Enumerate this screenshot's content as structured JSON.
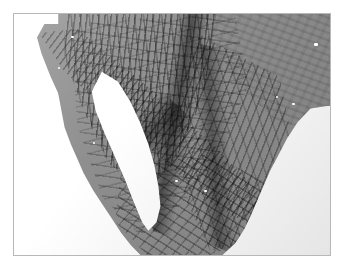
{
  "figure": {
    "kind": "shaded-relief-map",
    "title": "",
    "caption": "",
    "background_color": "#ffffff",
    "frame_border_color": "#b8b8bc",
    "frame": {
      "x": 13,
      "y": 13,
      "width": 318,
      "height": 243
    }
  },
  "map": {
    "type": "grayscale hillshade / shaded relief",
    "region": "Northwestern Mexico and Baja California",
    "land_base_color": "#8e8e8e",
    "ocean_color": "#ffffff",
    "shadow_color": "#3a3a3a",
    "highlight_color": "#d4d4d4",
    "illumination_azimuth": "northwest",
    "has_labels": false,
    "has_gridlines": false,
    "has_legend": false,
    "has_scalebar": false
  },
  "features": {
    "land": [
      {
        "name": "mainland-mexico",
        "description": "Mainland Mexico landmass filling centre and right of plate"
      },
      {
        "name": "baja-california-peninsula",
        "description": "Long narrow NW-SE peninsula at left"
      }
    ],
    "water": [
      {
        "name": "pacific-ocean",
        "description": "White ocean area along left and lower-left"
      },
      {
        "name": "gulf-of-california",
        "description": "White wedge separating peninsula from mainland"
      },
      {
        "name": "gulf-of-mexico",
        "description": "White ocean area at lower right"
      }
    ],
    "terrain": [
      {
        "name": "sierra-madre-occidental",
        "description": "Dense north-south ridge texture, upper left-centre"
      },
      {
        "name": "sierra-madre-oriental",
        "description": "Ridge belt running down right-centre"
      },
      {
        "name": "mexican-plateau",
        "description": "Smooth low-relief plains, upper right"
      },
      {
        "name": "peninsular-ranges",
        "description": "Dark spine along Baja peninsula"
      },
      {
        "name": "sierra-madre-del-sur",
        "description": "Rough dissected terrain, lower centre"
      }
    ],
    "water_spots": [
      {
        "name": "reservoir-1",
        "x_pct": 95,
        "y_pct": 12
      },
      {
        "name": "reservoir-2",
        "x_pct": 88,
        "y_pct": 37
      },
      {
        "name": "reservoir-3",
        "x_pct": 83,
        "y_pct": 34
      },
      {
        "name": "reservoir-4",
        "x_pct": 51,
        "y_pct": 69
      },
      {
        "name": "reservoir-5",
        "x_pct": 60,
        "y_pct": 73
      },
      {
        "name": "reservoir-6",
        "x_pct": 18,
        "y_pct": 9
      },
      {
        "name": "reservoir-7",
        "x_pct": 14,
        "y_pct": 22
      },
      {
        "name": "reservoir-8",
        "x_pct": 11,
        "y_pct": 26
      },
      {
        "name": "reservoir-9",
        "x_pct": 30,
        "y_pct": 49
      },
      {
        "name": "reservoir-10",
        "x_pct": 25,
        "y_pct": 53
      }
    ]
  }
}
